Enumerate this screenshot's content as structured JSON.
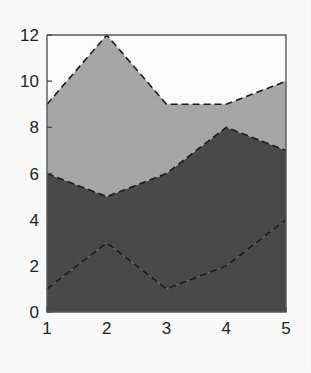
{
  "chart_data": {
    "type": "area",
    "title": "",
    "subtitle": "",
    "xlabel": "",
    "ylabel": "",
    "stacked": true,
    "grid": false,
    "legend_position": "none",
    "x": [
      1,
      2,
      3,
      4,
      5
    ],
    "xlim": [
      1,
      5
    ],
    "ylim": [
      0,
      12
    ],
    "xticks": [
      1,
      2,
      3,
      4,
      5
    ],
    "yticks": [
      0,
      2,
      4,
      6,
      8,
      10,
      12
    ],
    "xtick_labels": [
      "1",
      "2",
      "3",
      "4",
      "5"
    ],
    "ytick_labels": [
      "0",
      "2",
      "4",
      "6",
      "8",
      "10",
      "12"
    ],
    "categories": [
      "1",
      "2",
      "3",
      "4",
      "5"
    ],
    "series": [
      {
        "name": "series-1",
        "values": [
          1,
          3,
          1,
          2,
          4
        ],
        "color": "#4a4a4a"
      },
      {
        "name": "series-2",
        "values": [
          5,
          2,
          5,
          6,
          3
        ],
        "color": "#4a4a4a"
      },
      {
        "name": "series-3",
        "values": [
          3,
          7,
          3,
          1,
          3
        ],
        "color": "#a8a8a8"
      }
    ],
    "cumulative": [
      {
        "name": "boundary-1",
        "values": [
          1,
          3,
          1,
          2,
          4
        ]
      },
      {
        "name": "boundary-2",
        "values": [
          6,
          5,
          6,
          8,
          7
        ]
      },
      {
        "name": "boundary-3",
        "values": [
          9,
          12,
          9,
          9,
          10
        ]
      }
    ],
    "annotations": []
  },
  "figure": {
    "background_color": "#fdfdfd",
    "axis_color": "#5a5a5a",
    "edge_line_color": "#1b1b1b",
    "edge_line_style": "dashed"
  }
}
